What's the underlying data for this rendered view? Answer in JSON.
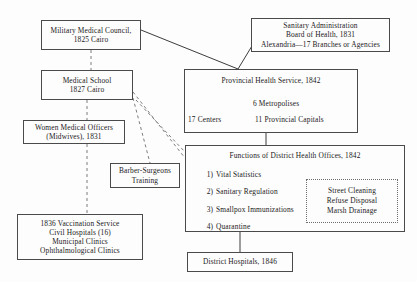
{
  "diagram": {
    "line_color": "#4a4a4a",
    "background": "#fdfdfd"
  },
  "nodes": {
    "military_medical_council": {
      "lines": [
        "Military Medical Council,",
        "1825 Cairo"
      ]
    },
    "sanitary_administration": {
      "lines": [
        "Sanitary Administration",
        "Board of Health, 1831",
        "Alexandria—17 Branches or Agencies"
      ]
    },
    "medical_school": {
      "lines": [
        "Medical School",
        "1827 Cairo"
      ]
    },
    "provincial_health_service": {
      "title": "Provincial Health Service, 1842",
      "metropolises": "6 Metropolises",
      "centers": "17 Centers",
      "provincial_capitals": "11 Provincial Capitals"
    },
    "women_medical_officers": {
      "lines": [
        "Women Medical Officers",
        "(Midwives), 1831"
      ]
    },
    "barber_surgeons": {
      "lines": [
        "Barber-Surgeons",
        "Training"
      ]
    },
    "vaccination_service": {
      "lines": [
        "1836 Vaccination Service",
        "Civil Hospitals (16)",
        "Municipal Clinics",
        "Ophthalmological Clinics"
      ]
    },
    "functions_district_health_offices": {
      "title": "Functions of District Health Offices, 1842",
      "items": [
        {
          "num": "1)",
          "label": "Vital Statistics"
        },
        {
          "num": "2)",
          "label": "Sanitary Regulation"
        },
        {
          "num": "3)",
          "label": "Smallpox Immunizations"
        },
        {
          "num": "4)",
          "label": "Quarantine"
        }
      ],
      "sub_box": {
        "lines": [
          "Street Cleaning",
          "Refuse Disposal",
          "Marsh Drainage"
        ]
      }
    },
    "district_hospitals": {
      "lines": [
        "District Hospitals, 1846"
      ]
    }
  }
}
